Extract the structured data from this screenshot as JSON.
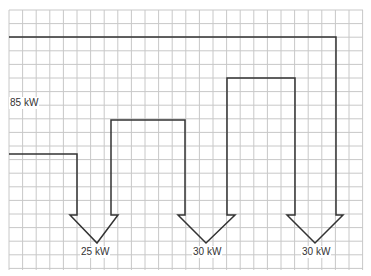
{
  "diagram": {
    "type": "sankey-flow-on-grid",
    "grid": {
      "x0": 9,
      "y0": 10,
      "x1": 363,
      "y1": 270,
      "cell": 13.6,
      "color": "#c8c8c8"
    },
    "line_color": "#333333",
    "input": {
      "label": "85 kW",
      "value": 85
    },
    "outputs": [
      {
        "label": "25 kW",
        "value": 25
      },
      {
        "label": "30 kW",
        "value": 30
      },
      {
        "label": "30 kW",
        "value": 30
      }
    ]
  }
}
